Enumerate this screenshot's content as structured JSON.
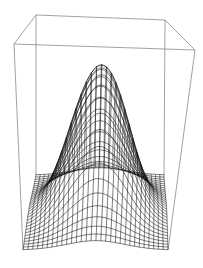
{
  "chart_data": {
    "type": "surface3d-wireframe",
    "title": "",
    "xlabel": "",
    "ylabel": "",
    "zlabel": "",
    "axes_ticks": "none",
    "grid": false,
    "legend": null,
    "function": "z = exp(-a*(x^2 + y^2)) (Gaussian bump)",
    "x_range": [
      -1,
      1
    ],
    "y_range": [
      -1,
      1
    ],
    "z_range": [
      0,
      1
    ],
    "mesh_resolution": [
      30,
      30
    ],
    "peak": {
      "x": 0,
      "y": 0,
      "z": 1
    },
    "bounding_box": true,
    "colors": {
      "mesh": "#111111",
      "box": "#8a8a8a",
      "background": "#ffffff"
    },
    "projection": {
      "floor_back_left": [
        36,
        175
      ],
      "floor_back_right": [
        164,
        175
      ],
      "floor_front_left": [
        23,
        250
      ],
      "floor_front_right": [
        168,
        250
      ],
      "top_back_left": [
        36,
        15
      ],
      "top_back_right": [
        165,
        20
      ],
      "top_front_left": [
        14,
        44
      ],
      "top_front_right": [
        195,
        50
      ]
    }
  }
}
